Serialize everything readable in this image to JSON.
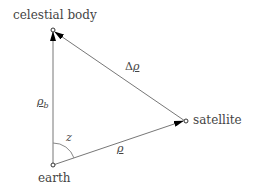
{
  "nodes": {
    "celestial_body": {
      "label": "celestial body"
    },
    "satellite": {
      "label": "satellite"
    },
    "earth": {
      "label": "earth"
    }
  },
  "vectors": {
    "rho_b": {
      "symbol": "ρ",
      "subscript": "b"
    },
    "delta_rho": {
      "prefix": "Δ",
      "symbol": "ρ"
    },
    "rho": {
      "symbol": "ρ"
    }
  },
  "angle": {
    "label": "z"
  },
  "colors": {
    "line": "#555555",
    "text": "#444444"
  }
}
